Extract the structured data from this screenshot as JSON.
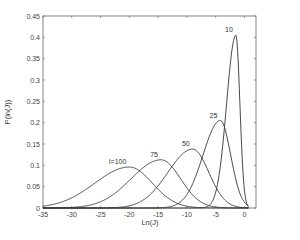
{
  "chart_data": {
    "type": "line",
    "title": "",
    "xlabel": "Ln(J)",
    "ylabel": "P(ln(J))",
    "xlim": [
      -35,
      2
    ],
    "ylim": [
      0,
      0.45
    ],
    "grid": false,
    "legend": "none (curves labeled inline)",
    "xticks": [
      -35,
      -30,
      -25,
      -20,
      -15,
      -10,
      -5,
      0
    ],
    "yticks": [
      0,
      0.05,
      0.1,
      0.15,
      0.2,
      0.25,
      0.3,
      0.35,
      0.4,
      0.45
    ],
    "series": [
      {
        "name": "10",
        "label": "10",
        "peak_x": -1.5,
        "peak_y": 0.405,
        "left_width": 1.6,
        "right_width": 0.7
      },
      {
        "name": "25",
        "label": "25",
        "peak_x": -4.2,
        "peak_y": 0.205,
        "left_width": 3.0,
        "right_width": 1.8
      },
      {
        "name": "50",
        "label": "50",
        "peak_x": -9.0,
        "peak_y": 0.138,
        "left_width": 4.3,
        "right_width": 2.8
      },
      {
        "name": "75",
        "label": "75",
        "peak_x": -14.5,
        "peak_y": 0.113,
        "left_width": 5.2,
        "right_width": 3.4
      },
      {
        "name": "100",
        "label": "l=100",
        "peak_x": -20.0,
        "peak_y": 0.096,
        "left_width": 6.0,
        "right_width": 4.0
      }
    ]
  }
}
